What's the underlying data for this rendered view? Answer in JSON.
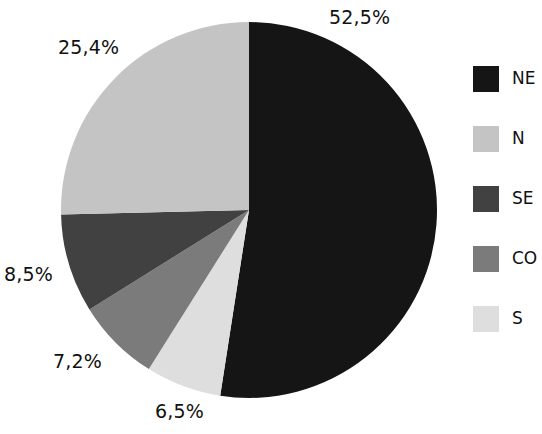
{
  "chart_data": {
    "type": "pie",
    "title": "",
    "xlabel": "",
    "ylabel": "",
    "categories": [
      "NE",
      "N",
      "SE",
      "CO",
      "S"
    ],
    "values": [
      52.5,
      25.4,
      8.5,
      7.2,
      6.5
    ],
    "labels": [
      "52,5%",
      "25,4%",
      "8,5%",
      "7,2%",
      "6,5%"
    ],
    "colors": [
      "#151515",
      "#c4c4c4",
      "#414141",
      "#7b7b7b",
      "#dedede"
    ],
    "start_angle_deg": 0,
    "direction": "clockwise",
    "legend_position": "right",
    "grid": false
  },
  "chart": {
    "slice_labels": {
      "ne": "52,5%",
      "n": "25,4%",
      "se": "8,5%",
      "co": "7,2%",
      "s": "6,5%"
    }
  },
  "legend": {
    "items": [
      {
        "label": "NE",
        "color": "#151515"
      },
      {
        "label": "N",
        "color": "#c4c4c4"
      },
      {
        "label": "SE",
        "color": "#414141"
      },
      {
        "label": "CO",
        "color": "#7b7b7b"
      },
      {
        "label": "S",
        "color": "#dedede"
      }
    ]
  }
}
